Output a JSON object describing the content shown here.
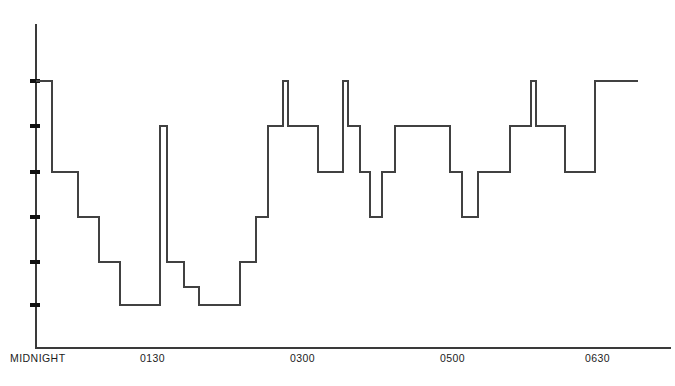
{
  "chart_data": {
    "type": "line",
    "subtype": "step",
    "title": "",
    "xlabel": "",
    "ylabel": "",
    "grid": false,
    "legend": null,
    "xlim": [
      0,
      675
    ],
    "ylim": [
      0,
      386
    ],
    "x_tick_labels": [
      "MIDNIGHT",
      "0130",
      "0300",
      "0500",
      "0630"
    ],
    "x_tick_positions_px": [
      10,
      140,
      290,
      440,
      585
    ],
    "y_tick_count": 6,
    "y_tick_positions_px": [
      81,
      126,
      172,
      217,
      262,
      305
    ],
    "y_tick_labels": [
      "",
      "",
      "",
      "",
      "",
      ""
    ],
    "axis_origin_px": [
      36,
      348
    ],
    "axis_top_px": 25,
    "axis_right_px": 670,
    "series": [
      {
        "name": "stage-trace",
        "color": "#414141",
        "step_segments": [
          {
            "x0": 36,
            "x1": 52,
            "y": 81
          },
          {
            "x0": 52,
            "x1": 78,
            "y": 172
          },
          {
            "x0": 78,
            "x1": 99,
            "y": 217
          },
          {
            "x0": 99,
            "x1": 120,
            "y": 262
          },
          {
            "x0": 120,
            "x1": 160,
            "y": 305
          },
          {
            "x0": 160,
            "x1": 167,
            "y": 126
          },
          {
            "x0": 167,
            "x1": 184,
            "y": 262
          },
          {
            "x0": 184,
            "x1": 199,
            "y": 287
          },
          {
            "x0": 199,
            "x1": 240,
            "y": 305
          },
          {
            "x0": 240,
            "x1": 256,
            "y": 262
          },
          {
            "x0": 256,
            "x1": 268,
            "y": 217
          },
          {
            "x0": 268,
            "x1": 283,
            "y": 126
          },
          {
            "x0": 283,
            "x1": 288,
            "y": 81
          },
          {
            "x0": 288,
            "x1": 318,
            "y": 126
          },
          {
            "x0": 318,
            "x1": 343,
            "y": 172
          },
          {
            "x0": 343,
            "x1": 348,
            "y": 81
          },
          {
            "x0": 348,
            "x1": 360,
            "y": 126
          },
          {
            "x0": 360,
            "x1": 370,
            "y": 172
          },
          {
            "x0": 370,
            "x1": 382,
            "y": 217
          },
          {
            "x0": 382,
            "x1": 395,
            "y": 172
          },
          {
            "x0": 395,
            "x1": 450,
            "y": 126
          },
          {
            "x0": 450,
            "x1": 462,
            "y": 172
          },
          {
            "x0": 462,
            "x1": 478,
            "y": 217
          },
          {
            "x0": 478,
            "x1": 510,
            "y": 172
          },
          {
            "x0": 510,
            "x1": 531,
            "y": 126
          },
          {
            "x0": 531,
            "x1": 536,
            "y": 81
          },
          {
            "x0": 536,
            "x1": 565,
            "y": 126
          },
          {
            "x0": 565,
            "x1": 595,
            "y": 172
          },
          {
            "x0": 595,
            "x1": 638,
            "y": 81
          }
        ]
      }
    ]
  },
  "axes": {
    "x_ticks": [
      {
        "label": "MIDNIGHT",
        "left": 10
      },
      {
        "label": "0130",
        "left": 140
      },
      {
        "label": "0300",
        "left": 290
      },
      {
        "label": "0500",
        "left": 440
      },
      {
        "label": "0630",
        "left": 585
      }
    ]
  },
  "caption": {
    "text": ""
  },
  "colors": {
    "trace": "#414141",
    "axis": "#3a3a3a",
    "tick": "#111111",
    "label_text": "#1c1c1c",
    "background": "#ffffff"
  }
}
